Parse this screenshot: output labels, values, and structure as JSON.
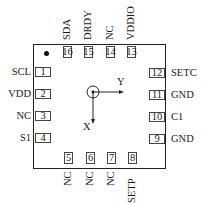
{
  "diagram": {
    "type": "ic-pinout",
    "package": "16-pin, 4 per side",
    "pin1_marker": "dot",
    "axes": {
      "x_label": "X",
      "y_label": "Y",
      "origin_symbol": "circle-dot"
    }
  },
  "pins": {
    "left": [
      {
        "num": "1",
        "name": "SCL"
      },
      {
        "num": "2",
        "name": "VDD"
      },
      {
        "num": "3",
        "name": "NC"
      },
      {
        "num": "4",
        "name": "S1"
      }
    ],
    "bottom": [
      {
        "num": "5",
        "name": "NC"
      },
      {
        "num": "6",
        "name": "NC"
      },
      {
        "num": "7",
        "name": "NC"
      },
      {
        "num": "8",
        "name": "SETP"
      }
    ],
    "right": [
      {
        "num": "9",
        "name": "GND"
      },
      {
        "num": "10",
        "name": "C1"
      },
      {
        "num": "11",
        "name": "GND"
      },
      {
        "num": "12",
        "name": "SETC"
      }
    ],
    "top": [
      {
        "num": "13",
        "name": "VDDIO"
      },
      {
        "num": "14",
        "name": "NC"
      },
      {
        "num": "15",
        "name": "DRDY"
      },
      {
        "num": "16",
        "name": "SDA"
      }
    ]
  }
}
